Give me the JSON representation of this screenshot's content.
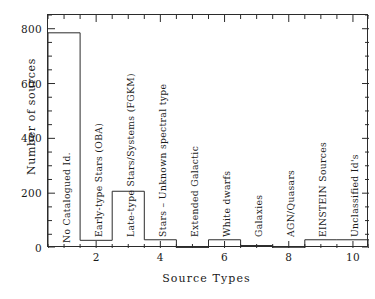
{
  "chart_data": {
    "type": "bar",
    "title": "",
    "xlabel": "Source Types",
    "ylabel": "Number of sources",
    "categories": [
      "No Catalogued Id.",
      "Early-type Stars (OBA)",
      "Late-type Stars/Systems (FGKM)",
      "Stars – Unknown spectral type",
      "Extended Galactic",
      "White dwarfs",
      "Galaxies",
      "AGN/Quasars",
      "EINSTEIN Sources",
      "Unclassified Id's"
    ],
    "x": [
      1,
      2,
      3,
      4,
      5,
      6,
      7,
      8,
      9,
      10
    ],
    "values": [
      785,
      28,
      207,
      30,
      2,
      30,
      9,
      1,
      30,
      30
    ],
    "xlim": [
      0.5,
      10.5
    ],
    "ylim": [
      0,
      850
    ],
    "xticks": [
      2,
      4,
      6,
      8,
      10
    ],
    "yticks": [
      0,
      200,
      400,
      600,
      800
    ],
    "xticklabels": [
      "2",
      "4",
      "6",
      "8",
      "10"
    ],
    "yticklabels": [
      "0",
      "200",
      "400",
      "600",
      "800"
    ],
    "grid": false,
    "legend": null,
    "line_color": "#2b2b2b",
    "background": "#ffffff",
    "style": "step-histogram-outline"
  },
  "axes": {
    "x_title": "Source Types",
    "y_title": "Number of sources"
  }
}
